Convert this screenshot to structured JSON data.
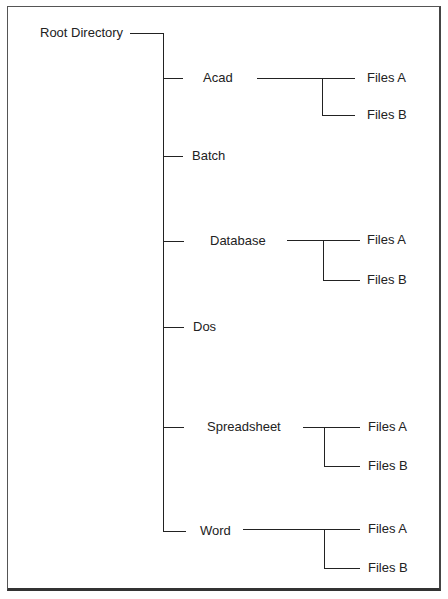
{
  "diagram": {
    "root": "Root Directory",
    "children": [
      {
        "label": "Acad",
        "files": [
          "Files A",
          "Files B"
        ]
      },
      {
        "label": "Batch",
        "files": []
      },
      {
        "label": "Database",
        "files": [
          "Files A",
          "Files B"
        ]
      },
      {
        "label": "Dos",
        "files": []
      },
      {
        "label": "Spreadsheet",
        "files": [
          "Files A",
          "Files B"
        ]
      },
      {
        "label": "Word",
        "files": [
          "Files A",
          "Files B"
        ]
      }
    ]
  }
}
